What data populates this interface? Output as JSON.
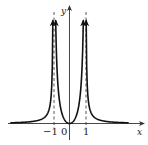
{
  "chart_data": {
    "type": "line",
    "title": "",
    "xlabel": "x",
    "ylabel": "y",
    "x_ticks": [
      {
        "value": -1,
        "label": "−1"
      },
      {
        "value": 0,
        "label": "0"
      },
      {
        "value": 1,
        "label": "1"
      }
    ],
    "vertical_asymptotes": [
      -1,
      1
    ],
    "horizontal_asymptote": 0,
    "grid": false,
    "legend": null,
    "series": [
      {
        "name": "left-outer-branch",
        "domain": [
          -3.7,
          -1.05
        ],
        "behavior": "approaches 0 as x→−∞, →+∞ as x→−1⁻"
      },
      {
        "name": "center-branch",
        "domain": [
          -0.62,
          0.62
        ],
        "behavior": "U-shape with minimum at (0,0), →+∞ as x→±1"
      },
      {
        "name": "right-outer-branch",
        "domain": [
          1.05,
          3.7
        ],
        "behavior": "→+∞ as x→1⁺, approaches 0 as x→+∞"
      }
    ],
    "notable_points": [
      {
        "x": 0,
        "y": 0
      }
    ]
  },
  "colors": {
    "curve": "#111111",
    "axis": "#333333",
    "asymptote": "#444444"
  }
}
